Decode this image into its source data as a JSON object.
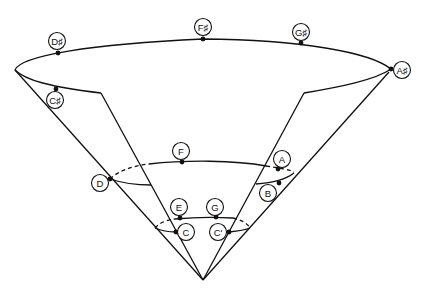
{
  "diagram": {
    "notes": [
      {
        "key": "d_sharp",
        "label": "D♯",
        "dot": [
          58,
          53
        ],
        "circle": [
          57,
          41
        ]
      },
      {
        "key": "f_sharp",
        "label": "F♯",
        "dot": [
          203,
          39
        ],
        "circle": [
          203,
          27
        ]
      },
      {
        "key": "g_sharp",
        "label": "G♯",
        "dot": [
          301,
          43
        ],
        "circle": [
          301,
          32
        ]
      },
      {
        "key": "a_sharp",
        "label": "A♯",
        "dot": [
          391,
          69
        ],
        "circle": [
          402,
          70
        ]
      },
      {
        "key": "c_sharp",
        "label": "C♯",
        "dot": [
          56,
          89
        ],
        "circle": [
          55,
          100
        ]
      },
      {
        "key": "f",
        "label": "F",
        "dot": [
          182,
          162
        ],
        "circle": [
          181,
          151
        ]
      },
      {
        "key": "a",
        "label": "A",
        "dot": [
          278,
          169
        ],
        "circle": [
          282,
          159
        ]
      },
      {
        "key": "b",
        "label": "B",
        "dot": [
          279,
          183
        ],
        "circle": [
          268,
          193
        ]
      },
      {
        "key": "d",
        "label": "D",
        "dot": [
          110,
          179
        ],
        "circle": [
          100,
          183
        ]
      },
      {
        "key": "e",
        "label": "E",
        "dot": [
          180,
          218
        ],
        "circle": [
          179,
          207
        ]
      },
      {
        "key": "g",
        "label": "G",
        "dot": [
          216,
          217
        ],
        "circle": [
          215,
          207
        ]
      },
      {
        "key": "c",
        "label": "C",
        "dot": [
          176,
          232
        ],
        "circle": [
          186,
          232
        ]
      },
      {
        "key": "c_prime",
        "label": "C'",
        "dot": [
          229,
          232
        ],
        "circle": [
          218,
          232
        ]
      }
    ]
  }
}
